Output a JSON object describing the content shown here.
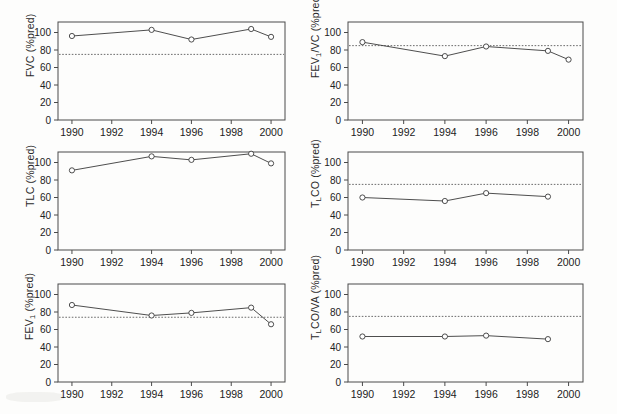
{
  "figure": {
    "panel_count": 6,
    "xlabel_common": "",
    "x_tick_labels": [
      "1990",
      "1992",
      "1994",
      "1996",
      "1998",
      "2000"
    ],
    "x_tick_values": [
      1990,
      1992,
      1994,
      1996,
      1998,
      2000
    ],
    "y_tick_labels": [
      "0",
      "20",
      "40",
      "60",
      "80",
      "100"
    ],
    "y_tick_values": [
      0,
      20,
      40,
      60,
      80,
      100
    ],
    "marker_style": "open-circle",
    "reference_line_style": "dotted",
    "line_color": "#3a3a3a",
    "marker_fill": "#ffffff",
    "reference_color": "#5a5a5a"
  },
  "chart_data": [
    {
      "type": "line",
      "panel_id": "fvc",
      "position": "top-left",
      "title": "",
      "xlabel": "",
      "ylabel": "FVC (%pred)",
      "ylabel_parts": {
        "main": "FVC",
        "sub": "",
        "tail": " (%pred)"
      },
      "xlim": [
        1989.3,
        2000.7
      ],
      "ylim": [
        0,
        112
      ],
      "grid": false,
      "legend": "none",
      "x": [
        1990,
        1994,
        1996,
        1999,
        2000
      ],
      "values": [
        96,
        103,
        92,
        104,
        95
      ],
      "reference_line": 75,
      "reference_label": "lower limit of normal"
    },
    {
      "type": "line",
      "panel_id": "fev1-vc",
      "position": "top-right",
      "title": "",
      "xlabel": "",
      "ylabel": "FEV1/VC (%pred)",
      "ylabel_parts": {
        "main": "FEV",
        "sub": "1",
        "tail": "/VC (%pred)"
      },
      "xlim": [
        1989.3,
        2000.7
      ],
      "ylim": [
        0,
        112
      ],
      "grid": false,
      "legend": "none",
      "x": [
        1990,
        1994,
        1996,
        1999,
        2000
      ],
      "values": [
        89,
        73,
        84,
        79,
        69
      ],
      "reference_line": 85,
      "reference_label": "lower limit of normal"
    },
    {
      "type": "line",
      "panel_id": "tlc",
      "position": "middle-left",
      "title": "",
      "xlabel": "",
      "ylabel": "TLC (%pred)",
      "ylabel_parts": {
        "main": "TLC",
        "sub": "",
        "tail": " (%pred)"
      },
      "xlim": [
        1989.3,
        2000.7
      ],
      "ylim": [
        0,
        112
      ],
      "grid": false,
      "legend": "none",
      "x": [
        1990,
        1994,
        1996,
        1999,
        2000
      ],
      "values": [
        91,
        107,
        103,
        110,
        99
      ],
      "reference_line": null,
      "reference_label": ""
    },
    {
      "type": "line",
      "panel_id": "tlco",
      "position": "middle-right",
      "title": "",
      "xlabel": "",
      "ylabel": "TLCO (%pred)",
      "ylabel_parts": {
        "main": "T",
        "sub": "L",
        "tail": "CO (%pred)"
      },
      "xlim": [
        1989.3,
        2000.7
      ],
      "ylim": [
        0,
        112
      ],
      "grid": false,
      "legend": "none",
      "x": [
        1990,
        1994,
        1996,
        1999
      ],
      "values": [
        60,
        56,
        65,
        61
      ],
      "reference_line": 75,
      "reference_label": "lower limit of normal"
    },
    {
      "type": "line",
      "panel_id": "fev1",
      "position": "bottom-left",
      "title": "",
      "xlabel": "",
      "ylabel": "FEV1 (%pred)",
      "ylabel_parts": {
        "main": "FEV",
        "sub": "1",
        "tail": " (%pred)"
      },
      "xlim": [
        1989.3,
        2000.7
      ],
      "ylim": [
        0,
        112
      ],
      "grid": false,
      "legend": "none",
      "x": [
        1990,
        1994,
        1996,
        1999,
        2000
      ],
      "values": [
        88,
        76,
        79,
        85,
        66
      ],
      "reference_line": 74,
      "reference_label": "lower limit of normal"
    },
    {
      "type": "line",
      "panel_id": "tlco-va",
      "position": "bottom-right",
      "title": "",
      "xlabel": "",
      "ylabel": "TLCO/VA (%pred)",
      "ylabel_parts": {
        "main": "T",
        "sub": "L",
        "tail": "CO/VA (%pred)"
      },
      "xlim": [
        1989.3,
        2000.7
      ],
      "ylim": [
        0,
        112
      ],
      "grid": false,
      "legend": "none",
      "x": [
        1990,
        1994,
        1996,
        1999
      ],
      "values": [
        52,
        52,
        53,
        49
      ],
      "reference_line": 75,
      "reference_label": "lower limit of normal"
    }
  ]
}
